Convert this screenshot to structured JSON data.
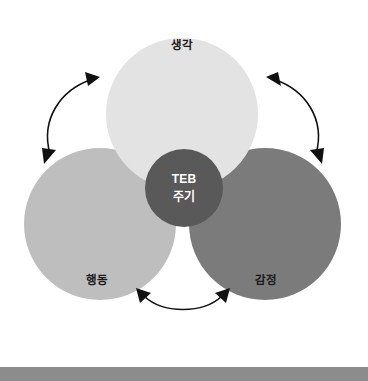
{
  "diagram": {
    "title_center": {
      "line1": "TEB",
      "line2": "주기"
    },
    "nodes": [
      {
        "id": "thought",
        "label": "생각",
        "color": "#e3e3e3",
        "cx": 182,
        "cy": 114,
        "r": 76,
        "label_x": 182,
        "label_y": 46
      },
      {
        "id": "behavior",
        "label": "행동",
        "color": "#bebebe",
        "cx": 100,
        "cy": 224,
        "r": 76,
        "label_x": 97,
        "label_y": 281
      },
      {
        "id": "emotion",
        "label": "감정",
        "color": "#7b7b7b",
        "cx": 265,
        "cy": 224,
        "r": 76,
        "label_x": 266,
        "label_y": 281
      }
    ],
    "center_node": {
      "color": "#595959",
      "cx": 184,
      "cy": 188,
      "r": 39
    },
    "arrows": [
      {
        "id": "behavior-to-thought",
        "name": "arrow-left",
        "double_headed": true,
        "stroke": "#111111"
      },
      {
        "id": "thought-to-emotion",
        "name": "arrow-right",
        "double_headed": true,
        "stroke": "#111111"
      },
      {
        "id": "behavior-to-emotion",
        "name": "arrow-bottom",
        "double_headed": true,
        "stroke": "#111111"
      }
    ]
  },
  "page": {
    "background": "#ffffff",
    "bottom_bar_color": "#8c8c8c",
    "bottom_bar_border": "#5e5e5e",
    "bottom_bar_top": 367,
    "bottom_bar_height": 14
  }
}
